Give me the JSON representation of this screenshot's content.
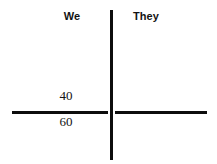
{
  "figure": {
    "background_color": "#ffffff",
    "line_color": "#0d0d0d",
    "text_color": "#131313"
  },
  "columns": [
    {
      "label": "We"
    },
    {
      "label": "They"
    }
  ],
  "values": {
    "above_line": "40",
    "below_line": "60"
  },
  "chart_data": {
    "type": "table",
    "title": "",
    "subtitle": "",
    "xlabel": "",
    "ylabel": "",
    "grid": false,
    "legend": "none",
    "columns": [
      "We",
      "They"
    ],
    "rows": [
      {
        "position": "above-axis",
        "We": "40",
        "They": ""
      },
      {
        "position": "below-axis",
        "We": "60",
        "They": ""
      }
    ],
    "annotations": [
      {
        "text": "We",
        "role": "column-header",
        "column": 0
      },
      {
        "text": "They",
        "role": "column-header",
        "column": 1
      },
      {
        "text": "40",
        "role": "cell-value",
        "column": 0,
        "placement": "above-horizontal-rule"
      },
      {
        "text": "60",
        "role": "cell-value",
        "column": 0,
        "placement": "below-horizontal-rule"
      }
    ],
    "axes": {
      "vertical_divider": true,
      "horizontal_rule": true
    }
  }
}
